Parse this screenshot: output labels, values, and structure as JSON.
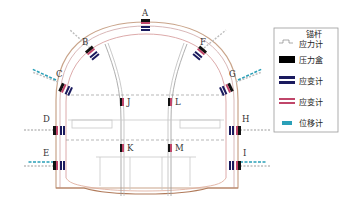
{
  "diagram": {
    "type": "tunnel-monitoring-cross-section",
    "points": [
      {
        "id": "A",
        "x": 145,
        "y": 24,
        "lx": 145,
        "ly": 15
      },
      {
        "id": "B",
        "x": 91,
        "y": 51,
        "lx": 86,
        "ly": 44
      },
      {
        "id": "C",
        "x": 62,
        "y": 86,
        "lx": 60,
        "ly": 76
      },
      {
        "id": "D",
        "x": 58,
        "y": 130,
        "lx": 47,
        "ly": 121
      },
      {
        "id": "E",
        "x": 58,
        "y": 164,
        "lx": 46,
        "ly": 155
      },
      {
        "id": "F",
        "x": 203,
        "y": 51,
        "lx": 203,
        "ly": 44
      },
      {
        "id": "G",
        "x": 230,
        "y": 86,
        "lx": 233,
        "ly": 76
      },
      {
        "id": "H",
        "x": 236,
        "y": 130,
        "lx": 245,
        "ly": 121
      },
      {
        "id": "I",
        "x": 236,
        "y": 164,
        "lx": 244,
        "ly": 155
      },
      {
        "id": "J",
        "x": 122,
        "y": 103,
        "lx": 131,
        "ly": 106
      },
      {
        "id": "K",
        "x": 122,
        "y": 148,
        "lx": 131,
        "ly": 151
      },
      {
        "id": "L",
        "x": 170,
        "y": 103,
        "lx": 178,
        "ly": 106
      },
      {
        "id": "M",
        "x": 170,
        "y": 148,
        "lx": 178,
        "ly": 151
      }
    ]
  },
  "legend": {
    "items": [
      {
        "label_line1": "锚杆",
        "label_line2": "应力计",
        "icon": "anchor-stress-meter-icon"
      },
      {
        "label_line1": "压力盒",
        "label_line2": "",
        "icon": "pressure-cell-icon",
        "color": "#000000"
      },
      {
        "label_line1": "应变计",
        "label_line2": "",
        "icon": "strain-gauge-blue-icon",
        "color": "#1a1a5e"
      },
      {
        "label_line1": "应变计",
        "label_line2": "",
        "icon": "strain-gauge-red-icon",
        "color": "#c0466a"
      },
      {
        "label_line1": "位移计",
        "label_line2": "",
        "icon": "displacement-meter-icon",
        "color": "#2aa0b8"
      }
    ]
  },
  "colors": {
    "lining_outer": "#c9a48a",
    "lining_inner": "#d8a0a0",
    "structure_gray": "#b0b0b0",
    "dashed": "#9a9a9a",
    "navy": "#1a1a5e",
    "pink": "#c0466a",
    "teal": "#2aa0b8"
  }
}
